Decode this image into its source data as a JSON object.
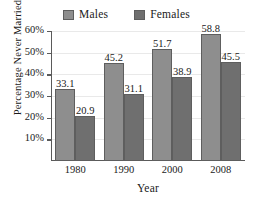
{
  "chart_data": {
    "type": "bar",
    "title": "",
    "xlabel": "Year",
    "ylabel": "Percentage Never Married",
    "categories": [
      "1980",
      "1990",
      "2000",
      "2008"
    ],
    "series": [
      {
        "name": "Males",
        "color": "#8e8e8e",
        "values": [
          33.1,
          45.2,
          51.7,
          58.8
        ]
      },
      {
        "name": "Females",
        "color": "#6f6f6f",
        "values": [
          20.9,
          31.1,
          38.9,
          45.5
        ]
      }
    ],
    "ylim": [
      0,
      60
    ],
    "yticks": [
      "10%",
      "20%",
      "30%",
      "40%",
      "50%",
      "60%"
    ],
    "ytick_values": [
      10,
      20,
      30,
      40,
      50,
      60
    ],
    "grid": true,
    "legend_position": "top-center",
    "value_labels": [
      [
        "33.1",
        "20.9"
      ],
      [
        "45.2",
        "31.1"
      ],
      [
        "51.7",
        "38.9"
      ],
      [
        "58.8",
        "45.5"
      ]
    ]
  },
  "legend": {
    "entries": [
      {
        "label": "Males"
      },
      {
        "label": "Females"
      }
    ]
  },
  "axes": {
    "y_title": "Percentage Never Married",
    "x_title": "Year"
  }
}
